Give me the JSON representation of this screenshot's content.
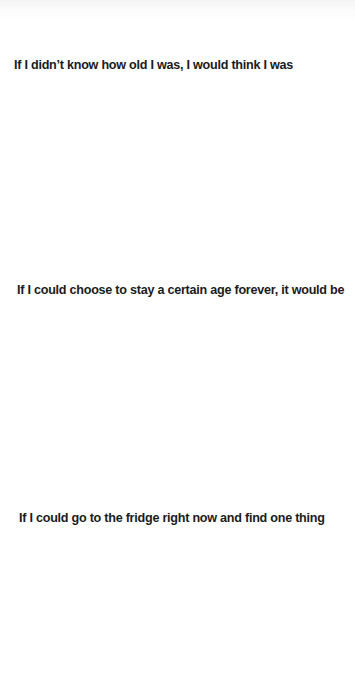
{
  "page": {
    "background_color": "#ffffff",
    "text_color": "#1b1b1b",
    "prompts": [
      {
        "text": "If I didn’t know how old I was, I would think I was"
      },
      {
        "text": "If I could choose to stay a certain age forever, it would be"
      },
      {
        "text": "If I could go to the fridge right now and find one thing"
      }
    ]
  }
}
